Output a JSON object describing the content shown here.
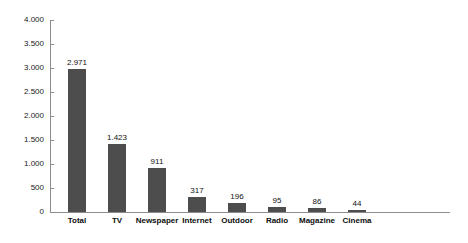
{
  "chart_data": {
    "type": "bar",
    "title": "",
    "subtitle": "",
    "xlabel": "",
    "ylabel": "",
    "categories": [
      "Total",
      "TV",
      "Newspaper",
      "Internet",
      "Outdoor",
      "Radio",
      "Magazine",
      "Cinema"
    ],
    "values": [
      2971,
      1423,
      911,
      317,
      196,
      95,
      86,
      44
    ],
    "value_labels": [
      "2.971",
      "1.423",
      "911",
      "317",
      "196",
      "95",
      "86",
      "44"
    ],
    "ylim": [
      0,
      4000
    ],
    "ytick_values": [
      0,
      500,
      1000,
      1500,
      2000,
      2500,
      3000,
      3500,
      4000
    ],
    "ytick_labels": [
      "0",
      "500",
      "1.000",
      "1.500",
      "2.000",
      "2.500",
      "3.000",
      "3.500",
      "4.000"
    ],
    "grid": false,
    "legend": null,
    "legend_position": "none",
    "bar_color": "#4d4d4d",
    "axis_color": "#8c8c8c",
    "background_color": "#ffffff",
    "text_color": "#111111"
  }
}
